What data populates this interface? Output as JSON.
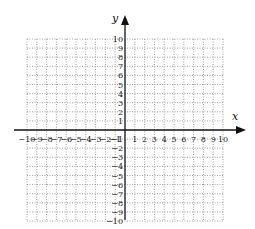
{
  "chart_data": {
    "type": "scatter",
    "title": "",
    "xlabel": "x",
    "ylabel": "y",
    "xlim": [
      -10,
      10
    ],
    "ylim": [
      -10,
      10
    ],
    "grid": true,
    "grid_style": "dotted",
    "x_ticks": [
      -10,
      -9,
      -8,
      -7,
      -6,
      -5,
      -4,
      -3,
      -2,
      -1,
      1,
      2,
      3,
      4,
      5,
      6,
      7,
      8,
      9,
      10
    ],
    "y_ticks": [
      -10,
      -9,
      -8,
      -7,
      -6,
      -5,
      -4,
      -3,
      -2,
      -1,
      1,
      2,
      3,
      4,
      5,
      6,
      7,
      8,
      9,
      10
    ],
    "series": [],
    "colors": {
      "grid": "#888888",
      "axis": "#111111",
      "background": "#ffffff"
    }
  },
  "labels": {
    "x_axis": "x",
    "y_axis": "y"
  }
}
